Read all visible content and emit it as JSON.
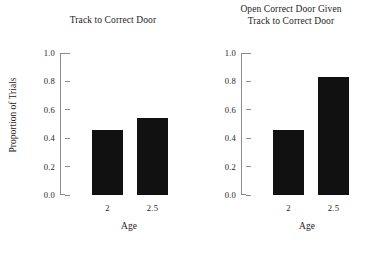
{
  "chart_data": [
    {
      "type": "bar",
      "title": "Track to Correct Door",
      "xlabel": "Age",
      "ylabel": "Proportion of Trials",
      "categories": [
        "2",
        "2.5"
      ],
      "values": [
        0.455,
        0.545
      ],
      "ylim": [
        0.0,
        1.0
      ],
      "yticks": [
        "0.0",
        "0.2",
        "0.4",
        "0.6",
        "0.8",
        "1.0"
      ],
      "ytick_values": [
        0.0,
        0.2,
        0.4,
        0.6,
        0.8,
        1.0
      ],
      "grid": false,
      "legend": null,
      "bar_color": "#111111"
    },
    {
      "type": "bar",
      "title": "Open Correct Door Given\nTrack to Correct Door",
      "title_line1": "Open Correct Door Given",
      "title_line2": "Track to Correct Door",
      "xlabel": "Age",
      "ylabel": "",
      "categories": [
        "2",
        "2.5"
      ],
      "values": [
        0.46,
        0.83
      ],
      "ylim": [
        0.0,
        1.0
      ],
      "yticks": [
        "0.0",
        "0.2",
        "0.4",
        "0.6",
        "0.8",
        "1.0"
      ],
      "ytick_values": [
        0.0,
        0.2,
        0.4,
        0.6,
        0.8,
        1.0
      ],
      "grid": false,
      "legend": null,
      "bar_color": "#111111"
    }
  ],
  "left_panel": {
    "title": "Track to Correct Door",
    "ylabel": "Proportion of Trials",
    "xlabel": "Age",
    "yticks": [
      "1.0",
      "0.8",
      "0.6",
      "0.4",
      "0.2",
      "0.0"
    ],
    "xticks": [
      "2",
      "2.5"
    ],
    "bars": [
      {
        "label": "2",
        "value": 0.455
      },
      {
        "label": "2.5",
        "value": 0.545
      }
    ]
  },
  "right_panel": {
    "title_line1": "Open Correct Door Given",
    "title_line2": "Track to Correct Door",
    "xlabel": "Age",
    "yticks": [
      "1.0",
      "0.8",
      "0.6",
      "0.4",
      "0.2",
      "0.0"
    ],
    "xticks": [
      "2",
      "2.5"
    ],
    "bars": [
      {
        "label": "2",
        "value": 0.46
      },
      {
        "label": "2.5",
        "value": 0.83
      }
    ]
  }
}
